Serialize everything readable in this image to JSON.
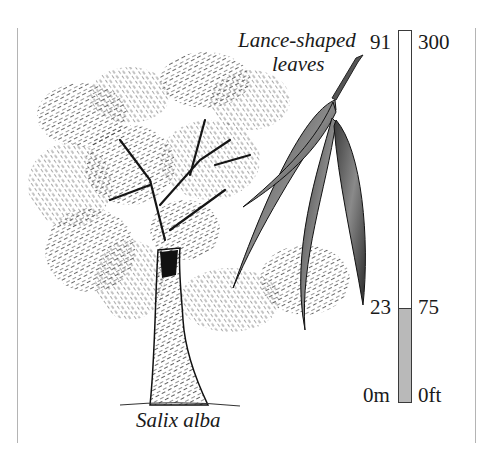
{
  "figure": {
    "species_label": "Salix alba",
    "leaf_callout": {
      "line1": "Lance-shaped",
      "line2": "leaves"
    }
  },
  "height_scale": {
    "metric": {
      "top": "91",
      "marker": "23",
      "bottom": "0m"
    },
    "imperial": {
      "top": "300",
      "marker": "75",
      "bottom": "0ft"
    },
    "fill_color": "#b9b9b9",
    "fill_fraction": 0.253
  },
  "icons": {
    "tree": "willow-tree-illustration",
    "leaves": "lance-leaf-illustration"
  }
}
